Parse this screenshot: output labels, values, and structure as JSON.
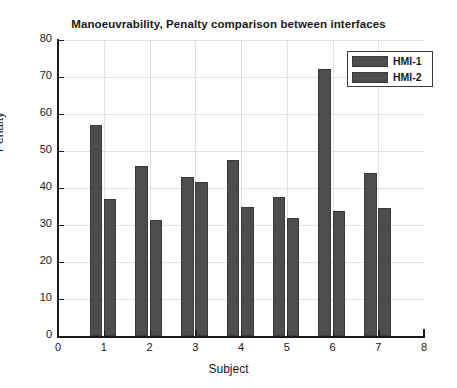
{
  "chart_data": {
    "type": "bar",
    "title": "Manoeuvrability, Penalty comparison between interfaces",
    "xlabel": "Subject",
    "ylabel": "Penalty",
    "categories": [
      "1",
      "2",
      "3",
      "4",
      "5",
      "6",
      "7"
    ],
    "series": [
      {
        "name": "HMI-1",
        "values": [
          57,
          46,
          43,
          47.5,
          37.5,
          72.3,
          44
        ]
      },
      {
        "name": "HMI-2",
        "values": [
          37,
          31.3,
          41.5,
          35,
          32,
          33.7,
          34.5
        ]
      }
    ],
    "xlim": [
      0,
      8
    ],
    "ylim": [
      0,
      80
    ],
    "xticks": [
      "0",
      "1",
      "2",
      "3",
      "4",
      "5",
      "6",
      "7",
      "8"
    ],
    "yticks": [
      "0",
      "10",
      "20",
      "30",
      "40",
      "50",
      "60",
      "70",
      "80"
    ],
    "grid": true,
    "legend_position": "top-right",
    "bar_color": "#4d4d4d",
    "bar_edge_color": "#3a3a3a",
    "axis_color": "#1a1a1a",
    "grid_color": "#e2e2e2",
    "background_color": "#ffffff"
  }
}
